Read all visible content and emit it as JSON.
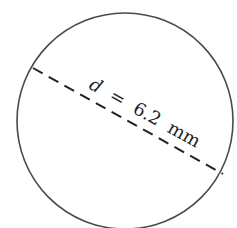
{
  "diagram": {
    "shape": "circle",
    "label": {
      "variable": "d",
      "equals": "=",
      "value": "6.2",
      "unit": "mm"
    },
    "full_label": "d = 6.2 mm",
    "line_style": "dashed",
    "colors": {
      "stroke": "#4a4a4a",
      "text": "#222222",
      "background": "#ffffff"
    }
  }
}
